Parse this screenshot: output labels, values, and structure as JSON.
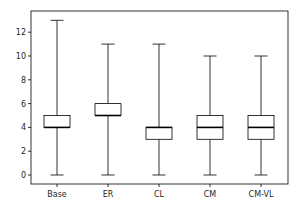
{
  "chart_data": {
    "type": "boxplot",
    "title": "",
    "xlabel": "",
    "ylabel": "",
    "categories": [
      "Base",
      "ER",
      "CL",
      "CM",
      "CM-VL"
    ],
    "series": [
      {
        "name": "Base",
        "min": 0,
        "q1": 4,
        "median": 4,
        "q3": 5,
        "max": 13
      },
      {
        "name": "ER",
        "min": 0,
        "q1": 5,
        "median": 5,
        "q3": 6,
        "max": 11
      },
      {
        "name": "CL",
        "min": 0,
        "q1": 3,
        "median": 4,
        "q3": 4,
        "max": 11
      },
      {
        "name": "CM",
        "min": 0,
        "q1": 3,
        "median": 4,
        "q3": 5,
        "max": 10
      },
      {
        "name": "CM-VL",
        "min": 0,
        "q1": 3,
        "median": 4,
        "q3": 5,
        "max": 10
      }
    ],
    "yticks": [
      0,
      2,
      4,
      6,
      8,
      10,
      12
    ],
    "ylim": [
      -0.75,
      13.7
    ],
    "grid": false,
    "legend": null
  },
  "style": {
    "frame_color": "#000000",
    "box_color": "#000000",
    "median_color": "#000000",
    "text_color": "#262626"
  }
}
